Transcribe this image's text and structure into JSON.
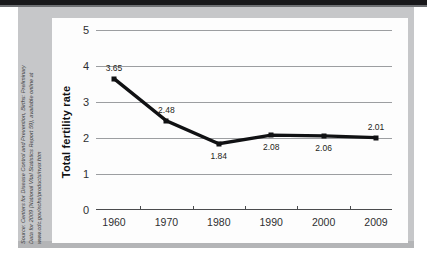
{
  "source_note": {
    "lines": [
      "Source: Centers for Disease Control and Prevention, Births: Preliminary",
      "Data for 2009 (National Vital Statistics Report 59), available online at",
      "www.cdc.gov/nchs/products/nvsr.htm"
    ]
  },
  "colors": {
    "line": "#101113",
    "gridline": "#9c9ea1",
    "axis": "#4a4b4d",
    "card_background": "#fdfdfd",
    "panel_background": "#c6c7c9"
  },
  "chart_data": {
    "type": "line",
    "title": "",
    "xlabel": "",
    "ylabel": "Total fertility rate",
    "categories": [
      "1960",
      "1970",
      "1980",
      "1990",
      "2000",
      "2009"
    ],
    "values": [
      3.65,
      2.48,
      1.84,
      2.08,
      2.06,
      2.01
    ],
    "point_labels": [
      "3.65",
      "2.48",
      "1.84",
      "2.08",
      "2.06",
      "2.01"
    ],
    "point_label_positions": [
      "above",
      "above",
      "below",
      "below",
      "below",
      "above"
    ],
    "ylim": [
      0,
      5
    ],
    "yticks": [
      "0",
      "1",
      "2",
      "3",
      "4",
      "5"
    ],
    "ytick_values": [
      0,
      1,
      2,
      3,
      4,
      5
    ],
    "xticks": [
      "1960",
      "1970",
      "1980",
      "1990",
      "2000",
      "2009"
    ],
    "grid": true,
    "legend": "none",
    "marker": "square"
  }
}
